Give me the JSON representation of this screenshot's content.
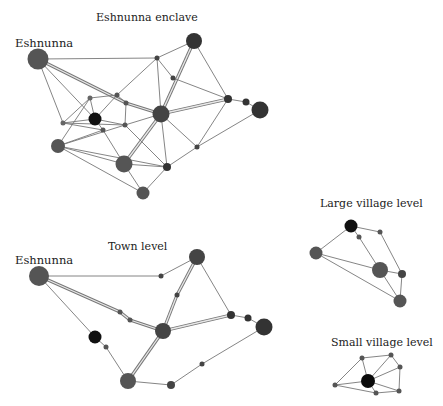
{
  "figure": {
    "panels": [
      {
        "id": "enclave",
        "title": "Eshnunna enclave",
        "title_pos": [
          96,
          11
        ],
        "place_label": "Eshnunna",
        "place_label_pos": [
          15,
          36
        ],
        "nodes": [
          {
            "id": "eshnunna",
            "x": 38,
            "y": 59,
            "r": 10.5,
            "color": "#555555"
          },
          {
            "id": "ne",
            "x": 194,
            "y": 41,
            "r": 8,
            "color": "#333333"
          },
          {
            "id": "n1",
            "x": 157,
            "y": 58,
            "r": 2.5,
            "color": "#444444"
          },
          {
            "id": "n2",
            "x": 173,
            "y": 78,
            "r": 2.5,
            "color": "#444444"
          },
          {
            "id": "n3",
            "x": 117,
            "y": 95,
            "r": 2.5,
            "color": "#555555"
          },
          {
            "id": "n4",
            "x": 90,
            "y": 98,
            "r": 2.5,
            "color": "#666666"
          },
          {
            "id": "n5",
            "x": 126,
            "y": 103,
            "r": 2.5,
            "color": "#555555"
          },
          {
            "id": "black",
            "x": 95,
            "y": 119,
            "r": 6.5,
            "color": "#111111"
          },
          {
            "id": "n6",
            "x": 63,
            "y": 123,
            "r": 2.5,
            "color": "#666666"
          },
          {
            "id": "n7",
            "x": 103,
            "y": 130,
            "r": 2.5,
            "color": "#555555"
          },
          {
            "id": "n8",
            "x": 125,
            "y": 125,
            "r": 2.5,
            "color": "#555555"
          },
          {
            "id": "center",
            "x": 161,
            "y": 114,
            "r": 8.5,
            "color": "#444444"
          },
          {
            "id": "e1",
            "x": 228,
            "y": 99,
            "r": 4,
            "color": "#333333"
          },
          {
            "id": "e2",
            "x": 246,
            "y": 102,
            "r": 3.5,
            "color": "#333333"
          },
          {
            "id": "e3",
            "x": 260,
            "y": 110,
            "r": 8.5,
            "color": "#333333"
          },
          {
            "id": "w1",
            "x": 58,
            "y": 146,
            "r": 7,
            "color": "#555555"
          },
          {
            "id": "s1",
            "x": 124,
            "y": 164,
            "r": 8.5,
            "color": "#555555"
          },
          {
            "id": "s2",
            "x": 167,
            "y": 167,
            "r": 4,
            "color": "#333333"
          },
          {
            "id": "s3",
            "x": 197,
            "y": 147,
            "r": 2.5,
            "color": "#444444"
          },
          {
            "id": "s4",
            "x": 143,
            "y": 193,
            "r": 6.5,
            "color": "#555555"
          }
        ],
        "edges": [
          [
            "eshnunna",
            "n1",
            1
          ],
          [
            "eshnunna",
            "n5",
            2
          ],
          [
            "eshnunna",
            "black",
            1
          ],
          [
            "eshnunna",
            "n6",
            1
          ],
          [
            "n5",
            "center",
            2
          ],
          [
            "n1",
            "ne",
            1
          ],
          [
            "ne",
            "center",
            2
          ],
          [
            "ne",
            "e1",
            1
          ],
          [
            "n1",
            "n3",
            1
          ],
          [
            "n1",
            "center",
            1
          ],
          [
            "n1",
            "n2",
            1
          ],
          [
            "n2",
            "e1",
            1
          ],
          [
            "center",
            "e1",
            2
          ],
          [
            "e1",
            "e2",
            1
          ],
          [
            "e2",
            "e3",
            1
          ],
          [
            "e3",
            "s3",
            1
          ],
          [
            "s3",
            "s2",
            1
          ],
          [
            "n3",
            "n4",
            1
          ],
          [
            "n3",
            "n5",
            1
          ],
          [
            "n4",
            "black",
            1
          ],
          [
            "n4",
            "n6",
            1
          ],
          [
            "n4",
            "w1",
            1
          ],
          [
            "n3",
            "black",
            1
          ],
          [
            "black",
            "n6",
            1
          ],
          [
            "black",
            "n7",
            1
          ],
          [
            "black",
            "n8",
            1
          ],
          [
            "n5",
            "n8",
            1
          ],
          [
            "n8",
            "center",
            1
          ],
          [
            "n7",
            "s1",
            1
          ],
          [
            "n6",
            "n7",
            1
          ],
          [
            "n6",
            "n8",
            1
          ],
          [
            "w1",
            "n7",
            1
          ],
          [
            "w1",
            "n8",
            1
          ],
          [
            "w1",
            "s1",
            1
          ],
          [
            "w1",
            "s4",
            1
          ],
          [
            "center",
            "s1",
            2
          ],
          [
            "center",
            "s2",
            1
          ],
          [
            "center",
            "s3",
            1
          ],
          [
            "n8",
            "s2",
            1
          ],
          [
            "s1",
            "s2",
            1
          ],
          [
            "s1",
            "s4",
            1
          ],
          [
            "s4",
            "s2",
            1
          ],
          [
            "e1",
            "s3",
            1
          ],
          [
            "w1",
            "s2",
            1
          ]
        ]
      },
      {
        "id": "town",
        "title": "Town level",
        "title_pos": [
          108,
          240
        ],
        "place_label": "Eshnunna",
        "place_label_pos": [
          15,
          253
        ],
        "nodes": [
          {
            "id": "eshnunna",
            "x": 39,
            "y": 276,
            "r": 10,
            "color": "#555555"
          },
          {
            "id": "t1",
            "x": 161,
            "y": 276,
            "r": 2.5,
            "color": "#444444"
          },
          {
            "id": "ne",
            "x": 197,
            "y": 257,
            "r": 8,
            "color": "#444444"
          },
          {
            "id": "t2",
            "x": 177,
            "y": 295,
            "r": 2.5,
            "color": "#444444"
          },
          {
            "id": "t3",
            "x": 120,
            "y": 312,
            "r": 2.5,
            "color": "#555555"
          },
          {
            "id": "t4",
            "x": 130,
            "y": 320,
            "r": 2.5,
            "color": "#555555"
          },
          {
            "id": "center",
            "x": 163,
            "y": 331,
            "r": 8,
            "color": "#444444"
          },
          {
            "id": "e1",
            "x": 231,
            "y": 315,
            "r": 4,
            "color": "#333333"
          },
          {
            "id": "e2",
            "x": 248,
            "y": 318,
            "r": 3.5,
            "color": "#333333"
          },
          {
            "id": "e3",
            "x": 264,
            "y": 327,
            "r": 8.5,
            "color": "#333333"
          },
          {
            "id": "black",
            "x": 95,
            "y": 337,
            "r": 6.5,
            "color": "#111111"
          },
          {
            "id": "t5",
            "x": 106,
            "y": 347,
            "r": 2.5,
            "color": "#555555"
          },
          {
            "id": "s1",
            "x": 128,
            "y": 381,
            "r": 8,
            "color": "#555555"
          },
          {
            "id": "s2",
            "x": 171,
            "y": 385,
            "r": 4,
            "color": "#444444"
          },
          {
            "id": "t6",
            "x": 202,
            "y": 364,
            "r": 2.5,
            "color": "#444444"
          }
        ],
        "edges": [
          [
            "eshnunna",
            "t1",
            1
          ],
          [
            "t1",
            "ne",
            1
          ],
          [
            "eshnunna",
            "t3",
            2
          ],
          [
            "t3",
            "t4",
            2
          ],
          [
            "t4",
            "center",
            2
          ],
          [
            "eshnunna",
            "black",
            1
          ],
          [
            "black",
            "t5",
            1
          ],
          [
            "t5",
            "s1",
            1
          ],
          [
            "ne",
            "t2",
            2
          ],
          [
            "t2",
            "center",
            2
          ],
          [
            "ne",
            "e1",
            1
          ],
          [
            "center",
            "e1",
            2
          ],
          [
            "e1",
            "e2",
            1
          ],
          [
            "e2",
            "e3",
            1
          ],
          [
            "center",
            "s1",
            2
          ],
          [
            "s1",
            "s2",
            1
          ],
          [
            "s2",
            "t6",
            1
          ],
          [
            "t6",
            "e3",
            1
          ]
        ]
      },
      {
        "id": "large-village",
        "title": "Large village level",
        "title_pos": [
          320,
          197
        ],
        "place_label": "",
        "nodes": [
          {
            "id": "black",
            "x": 351,
            "y": 226,
            "r": 6.5,
            "color": "#111111"
          },
          {
            "id": "v1",
            "x": 380,
            "y": 232,
            "r": 2.5,
            "color": "#555555"
          },
          {
            "id": "v2",
            "x": 359,
            "y": 237,
            "r": 2.5,
            "color": "#555555"
          },
          {
            "id": "w",
            "x": 316,
            "y": 253,
            "r": 6.5,
            "color": "#555555"
          },
          {
            "id": "center",
            "x": 380,
            "y": 270,
            "r": 8,
            "color": "#555555"
          },
          {
            "id": "e",
            "x": 402,
            "y": 274,
            "r": 4,
            "color": "#444444"
          },
          {
            "id": "s",
            "x": 400,
            "y": 301,
            "r": 6.5,
            "color": "#555555"
          }
        ],
        "edges": [
          [
            "black",
            "v1",
            1
          ],
          [
            "black",
            "v2",
            1
          ],
          [
            "v2",
            "center",
            1
          ],
          [
            "black",
            "w",
            1
          ],
          [
            "v1",
            "e",
            1
          ],
          [
            "w",
            "center",
            1
          ],
          [
            "w",
            "s",
            1
          ],
          [
            "center",
            "e",
            1
          ],
          [
            "center",
            "s",
            1
          ],
          [
            "e",
            "s",
            1
          ]
        ]
      },
      {
        "id": "small-village",
        "title": "Small village level",
        "title_pos": [
          331,
          336
        ],
        "place_label": "",
        "nodes": [
          {
            "id": "n1",
            "x": 362,
            "y": 358,
            "r": 2.5,
            "color": "#555555"
          },
          {
            "id": "n2",
            "x": 391,
            "y": 355,
            "r": 2.5,
            "color": "#555555"
          },
          {
            "id": "n3",
            "x": 400,
            "y": 367,
            "r": 2.5,
            "color": "#555555"
          },
          {
            "id": "w",
            "x": 335,
            "y": 385,
            "r": 2.5,
            "color": "#555555"
          },
          {
            "id": "black",
            "x": 368,
            "y": 381,
            "r": 7,
            "color": "#0a0a0a"
          },
          {
            "id": "s1",
            "x": 376,
            "y": 393,
            "r": 2.5,
            "color": "#555555"
          },
          {
            "id": "s2",
            "x": 399,
            "y": 391,
            "r": 2.5,
            "color": "#555555"
          }
        ],
        "edges": [
          [
            "n1",
            "n2",
            1
          ],
          [
            "n2",
            "n3",
            1
          ],
          [
            "n1",
            "w",
            1
          ],
          [
            "n1",
            "black",
            1
          ],
          [
            "n2",
            "black",
            1
          ],
          [
            "n3",
            "black",
            1
          ],
          [
            "n3",
            "s2",
            1
          ],
          [
            "w",
            "black",
            1
          ],
          [
            "w",
            "s1",
            1
          ],
          [
            "black",
            "s1",
            1
          ],
          [
            "black",
            "s2",
            1
          ],
          [
            "s1",
            "s2",
            1
          ]
        ]
      }
    ],
    "edge_color": "#777777",
    "double_edge_fill": "#e8e8e8"
  }
}
